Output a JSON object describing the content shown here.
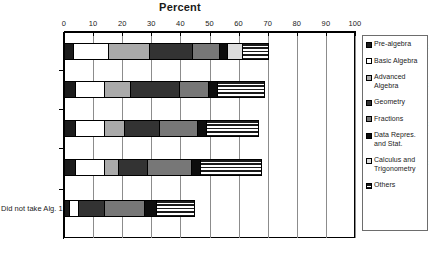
{
  "chart_data": {
    "type": "bar",
    "orientation": "horizontal",
    "stacked": true,
    "title": "Percent",
    "xlabel": "",
    "ylabel": "",
    "xlim": [
      0,
      100
    ],
    "xticks": [
      0,
      10,
      20,
      30,
      40,
      50,
      60,
      70,
      80,
      90,
      100
    ],
    "grid": true,
    "legend_position": "right",
    "categories": [
      "Took Alg. 1 at\n7th/8th Grade",
      "Took Alg. 1 at\n9th Grade",
      "Took Alg. 1 at\n10th Grade",
      "Took Alg. 1 at\n11th/12th Grade",
      "Did not take Alg. 1"
    ],
    "series": [
      {
        "name": "Pre-algebra",
        "values": [
          3.5,
          4,
          4,
          4,
          2
        ]
      },
      {
        "name": "Basic Algebra",
        "values": [
          12,
          10,
          10,
          10,
          3
        ]
      },
      {
        "name": "Advanced\nAlgebra",
        "values": [
          14,
          9,
          7,
          5,
          0
        ]
      },
      {
        "name": "Geometry",
        "values": [
          15,
          17,
          12,
          10,
          9
        ]
      },
      {
        "name": "Fractions",
        "values": [
          9,
          10,
          13,
          15,
          14
        ]
      },
      {
        "name": "Data Repres.\nand Stat.",
        "values": [
          3,
          3,
          3,
          3,
          4
        ]
      },
      {
        "name": "Calculus and\nTrigonometry",
        "values": [
          5,
          0,
          0,
          0,
          0
        ]
      },
      {
        "name": "Others",
        "values": [
          9,
          16,
          18,
          21,
          13
        ]
      }
    ]
  },
  "title": "Percent",
  "axis": {
    "ticks": [
      "0",
      "10",
      "20",
      "30",
      "40",
      "50",
      "60",
      "70",
      "80",
      "90",
      "100"
    ]
  },
  "categories": [
    {
      "line1": "Took Alg. 1 at",
      "line2": "7th/8th Grade"
    },
    {
      "line1": "Took Alg. 1 at",
      "line2": "9th Grade"
    },
    {
      "line1": "Took Alg. 1 at",
      "line2": "10th Grade"
    },
    {
      "line1": "Took Alg. 1 at",
      "line2": "11th/12th Grade"
    },
    {
      "line1": "Did not take Alg. 1",
      "line2": ""
    }
  ],
  "legend": {
    "items": [
      {
        "label": "Pre-algebra",
        "pattern": "solid-black",
        "color": "#1c1c1c"
      },
      {
        "label": "Basic Algebra",
        "pattern": "solid-white",
        "color": "#ffffff"
      },
      {
        "label": "Advanced\nAlgebra",
        "pattern": "light-gray",
        "color": "#aaaaaa"
      },
      {
        "label": "Geometry",
        "pattern": "dark-gray",
        "color": "#333333"
      },
      {
        "label": "Fractions",
        "pattern": "medium-gray",
        "color": "#777777"
      },
      {
        "label": "Data Repres.\nand Stat.",
        "pattern": "solid-black",
        "color": "#0d0d0d"
      },
      {
        "label": "Calculus and\nTrigonometry",
        "pattern": "very-light",
        "color": "#dcdcdc"
      },
      {
        "label": "Others",
        "pattern": "horiz-hatch",
        "color": "#1a1a1a"
      }
    ]
  }
}
